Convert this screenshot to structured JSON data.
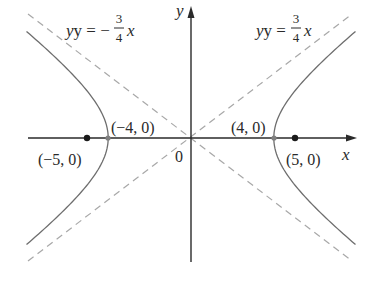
{
  "figure": {
    "type": "hyperbola",
    "equation": "x^2/16 - y^2/9 = 1",
    "a": 4,
    "b": 3,
    "c": 5,
    "axes": {
      "x_label": "x",
      "y_label": "y",
      "origin_label": "0"
    },
    "asymptotes": [
      {
        "label_lhs": "y = −",
        "num": "3",
        "den": "4",
        "var": "x",
        "slope": -0.75
      },
      {
        "label_lhs": "y = ",
        "num": "3",
        "den": "4",
        "var": "x",
        "slope": 0.75
      }
    ],
    "vertices": [
      {
        "label": "(−4, 0)",
        "x": -4,
        "y": 0
      },
      {
        "label": "(4, 0)",
        "x": 4,
        "y": 0
      }
    ],
    "foci": [
      {
        "label": "(−5, 0)",
        "x": -5,
        "y": 0
      },
      {
        "label": "(5, 0)",
        "x": 5,
        "y": 0
      }
    ],
    "colors": {
      "axis": "#2a2a2a",
      "curve": "#6e6e6e",
      "asymptote": "#a8a8a8",
      "focus": "#1a1a1a",
      "vertex": "#808080"
    }
  }
}
